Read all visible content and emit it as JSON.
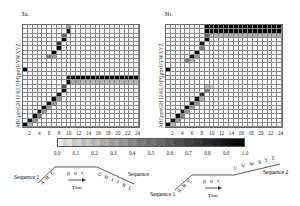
{
  "figure": {
    "panels": [
      {
        "id": "3a",
        "label": "3a.",
        "y_axis_label": "ABCρστGH IJ KLOPQρστUVWXYZ"
      },
      {
        "id": "3b",
        "label": "3b.",
        "y_axis_label": "ABCρστGH IJ KLOPQρστUVWXYZ"
      }
    ],
    "x_ticks": [
      "2",
      "4",
      "6",
      "8",
      "10",
      "12",
      "14",
      "16",
      "18",
      "20",
      "22",
      "24"
    ],
    "colorbar": {
      "ticks": [
        "0.0",
        "0.1",
        "0.2",
        "0.3",
        "0.4",
        "0.5",
        "0.6",
        "0.7",
        "0.8",
        "0.9",
        "1.0"
      ]
    },
    "diagram_a": {
      "seq_label_left": "Sequence 1",
      "seq_label_right": "Sequence",
      "letters_left": [
        "A",
        "B",
        "C"
      ],
      "letters_mid": [
        "ρ",
        "σ",
        "τ"
      ],
      "letters_right": [
        "G",
        "H",
        "I",
        "J",
        "K",
        "L"
      ],
      "time_label": "Time"
    },
    "diagram_b": {
      "seq_label_left": "Sequence 1",
      "seq_label_right": "Sequence 2",
      "letters_left": [
        "A",
        "B",
        "C"
      ],
      "letters_mid": [
        "ρ",
        "σ",
        "τ"
      ],
      "letters_right": [
        "U",
        "V",
        "W",
        "X",
        "Y",
        "Z"
      ],
      "time_label": "Time"
    }
  },
  "chart_data": [
    {
      "type": "heatmap",
      "title": "3a.",
      "xlabel": "time step",
      "x": [
        1,
        2,
        3,
        4,
        5,
        6,
        7,
        8,
        9,
        10,
        11,
        12,
        13,
        14,
        15,
        16,
        17,
        18,
        19,
        20,
        21,
        22,
        23,
        24
      ],
      "y_labels_bottom_to_top": [
        "A",
        "B",
        "C",
        "ρ",
        "σ",
        "τ",
        "G",
        "H",
        "I",
        "J",
        "K",
        "L",
        "O",
        "P",
        "Q",
        "ρ",
        "σ",
        "τ",
        "U",
        "V",
        "W",
        "X",
        "Y",
        "Z"
      ],
      "value_range": [
        0,
        1
      ],
      "description": "Diagonal activation rising from A at t=1 to L at t~10, then sustained dark band at rows K-L from t=10 to t=24; secondary diagonal in upper rows (ρστUVW...) from t~6 to t~10; isolated dark cell at t=1 row P.",
      "active_cells": [
        [
          1,
          0,
          1.0
        ],
        [
          2,
          1,
          0.9
        ],
        [
          2,
          0,
          0.3
        ],
        [
          3,
          2,
          1.0
        ],
        [
          3,
          1,
          0.4
        ],
        [
          4,
          3,
          0.9
        ],
        [
          4,
          2,
          0.5
        ],
        [
          5,
          4,
          1.0
        ],
        [
          5,
          3,
          0.4
        ],
        [
          6,
          5,
          0.9
        ],
        [
          6,
          4,
          0.4
        ],
        [
          7,
          6,
          1.0
        ],
        [
          7,
          5,
          0.4
        ],
        [
          8,
          7,
          0.9
        ],
        [
          8,
          6,
          0.4
        ],
        [
          9,
          8,
          1.0
        ],
        [
          9,
          9,
          0.7
        ],
        [
          10,
          10,
          1.0
        ],
        [
          10,
          11,
          0.9
        ],
        [
          11,
          11,
          1.0
        ],
        [
          12,
          11,
          1.0
        ],
        [
          13,
          11,
          1.0
        ],
        [
          14,
          11,
          1.0
        ],
        [
          15,
          11,
          1.0
        ],
        [
          16,
          11,
          1.0
        ],
        [
          17,
          11,
          1.0
        ],
        [
          18,
          11,
          1.0
        ],
        [
          19,
          11,
          1.0
        ],
        [
          20,
          11,
          1.0
        ],
        [
          21,
          11,
          1.0
        ],
        [
          22,
          11,
          1.0
        ],
        [
          23,
          11,
          1.0
        ],
        [
          24,
          11,
          1.0
        ],
        [
          11,
          10,
          0.35
        ],
        [
          12,
          10,
          0.35
        ],
        [
          13,
          10,
          0.3
        ],
        [
          14,
          10,
          0.3
        ],
        [
          15,
          10,
          0.3
        ],
        [
          16,
          10,
          0.3
        ],
        [
          17,
          10,
          0.3
        ],
        [
          18,
          10,
          0.3
        ],
        [
          19,
          10,
          0.3
        ],
        [
          20,
          10,
          0.3
        ],
        [
          21,
          10,
          0.3
        ],
        [
          22,
          10,
          0.3
        ],
        [
          23,
          10,
          0.3
        ],
        [
          24,
          10,
          0.3
        ],
        [
          6,
          16,
          0.5
        ],
        [
          7,
          17,
          1.0
        ],
        [
          7,
          16,
          0.4
        ],
        [
          8,
          18,
          1.0
        ],
        [
          8,
          19,
          0.8
        ],
        [
          9,
          20,
          1.0
        ],
        [
          9,
          21,
          0.6
        ],
        [
          10,
          22,
          0.9
        ],
        [
          10,
          23,
          0.4
        ],
        [
          1,
          13,
          1.0
        ]
      ]
    },
    {
      "type": "heatmap",
      "title": "3b.",
      "xlabel": "time step",
      "x": [
        1,
        2,
        3,
        4,
        5,
        6,
        7,
        8,
        9,
        10,
        11,
        12,
        13,
        14,
        15,
        16,
        17,
        18,
        19,
        20,
        21,
        22,
        23,
        24
      ],
      "y_labels_bottom_to_top": [
        "A",
        "B",
        "C",
        "ρ",
        "σ",
        "τ",
        "G",
        "H",
        "I",
        "J",
        "K",
        "L",
        "O",
        "P",
        "Q",
        "ρ",
        "σ",
        "τ",
        "U",
        "V",
        "W",
        "X",
        "Y",
        "Z"
      ],
      "value_range": [
        0,
        1
      ],
      "description": "Lower diagonal from A at t=1 fading by row J at t~10; upper diagonal from ρ at t~6 rising to Z at t~9, then sustained dark band at rows Y-Z from t=9 to t=24; isolated dark cell at t=1 row P.",
      "active_cells": [
        [
          1,
          0,
          1.0
        ],
        [
          2,
          1,
          0.9
        ],
        [
          2,
          0,
          0.3
        ],
        [
          3,
          2,
          1.0
        ],
        [
          3,
          1,
          0.4
        ],
        [
          4,
          3,
          0.9
        ],
        [
          4,
          2,
          0.5
        ],
        [
          5,
          4,
          1.0
        ],
        [
          5,
          3,
          0.4
        ],
        [
          6,
          5,
          0.9
        ],
        [
          6,
          4,
          0.4
        ],
        [
          7,
          6,
          0.9
        ],
        [
          7,
          5,
          0.4
        ],
        [
          8,
          7,
          0.8
        ],
        [
          8,
          6,
          0.3
        ],
        [
          9,
          8,
          0.5
        ],
        [
          9,
          9,
          0.3
        ],
        [
          10,
          9,
          0.2
        ],
        [
          5,
          15,
          0.5
        ],
        [
          6,
          16,
          0.9
        ],
        [
          6,
          15,
          0.3
        ],
        [
          7,
          17,
          1.0
        ],
        [
          7,
          16,
          0.4
        ],
        [
          8,
          19,
          0.9
        ],
        [
          8,
          18,
          0.5
        ],
        [
          9,
          20,
          1.0
        ],
        [
          9,
          21,
          0.6
        ],
        [
          9,
          22,
          1.0
        ],
        [
          9,
          23,
          1.0
        ],
        [
          10,
          22,
          1.0
        ],
        [
          10,
          23,
          1.0
        ],
        [
          11,
          22,
          1.0
        ],
        [
          11,
          23,
          1.0
        ],
        [
          12,
          22,
          1.0
        ],
        [
          12,
          23,
          1.0
        ],
        [
          13,
          22,
          1.0
        ],
        [
          13,
          23,
          1.0
        ],
        [
          14,
          22,
          1.0
        ],
        [
          14,
          23,
          1.0
        ],
        [
          15,
          22,
          1.0
        ],
        [
          15,
          23,
          1.0
        ],
        [
          16,
          22,
          1.0
        ],
        [
          16,
          23,
          1.0
        ],
        [
          17,
          22,
          1.0
        ],
        [
          17,
          23,
          1.0
        ],
        [
          18,
          22,
          1.0
        ],
        [
          18,
          23,
          1.0
        ],
        [
          19,
          22,
          1.0
        ],
        [
          19,
          23,
          1.0
        ],
        [
          20,
          22,
          1.0
        ],
        [
          20,
          23,
          1.0
        ],
        [
          21,
          22,
          1.0
        ],
        [
          21,
          23,
          1.0
        ],
        [
          22,
          22,
          1.0
        ],
        [
          22,
          23,
          1.0
        ],
        [
          23,
          22,
          1.0
        ],
        [
          23,
          23,
          1.0
        ],
        [
          24,
          22,
          1.0
        ],
        [
          24,
          23,
          1.0
        ],
        [
          10,
          21,
          0.3
        ],
        [
          11,
          21,
          0.3
        ],
        [
          12,
          21,
          0.3
        ],
        [
          13,
          21,
          0.3
        ],
        [
          14,
          21,
          0.3
        ],
        [
          15,
          21,
          0.3
        ],
        [
          16,
          21,
          0.3
        ],
        [
          17,
          21,
          0.3
        ],
        [
          18,
          21,
          0.3
        ],
        [
          19,
          21,
          0.3
        ],
        [
          20,
          21,
          0.3
        ],
        [
          21,
          21,
          0.3
        ],
        [
          22,
          21,
          0.3
        ],
        [
          23,
          21,
          0.3
        ],
        [
          24,
          21,
          0.3
        ],
        [
          1,
          13,
          1.0
        ]
      ]
    },
    {
      "type": "heatmap",
      "title": "colorbar",
      "ticks": [
        0.0,
        0.1,
        0.2,
        0.3,
        0.4,
        0.5,
        0.6,
        0.7,
        0.8,
        0.9,
        1.0
      ],
      "range": [
        0,
        1
      ],
      "colormap": "white-to-black grayscale"
    }
  ]
}
